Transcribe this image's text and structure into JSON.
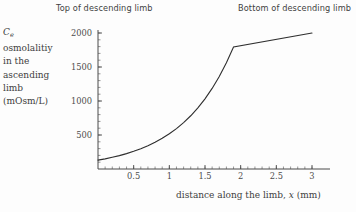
{
  "annotations": {
    "top_left": "Top of descending limb",
    "top_right": "Bottom of descending limb"
  },
  "ylabel": {
    "line1_symbol": "C",
    "line1_subscript": "e",
    "line2": "osmolalitiy",
    "line3": "in the",
    "line4": "ascending",
    "line5": "limb",
    "line6": "(mOsm/L)"
  },
  "xlabel": {
    "prefix": "distance along the limb, ",
    "symbol": "x",
    "suffix": " (mm)"
  },
  "axis": {
    "x_ticks": [
      "0.5",
      "1",
      "1.5",
      "2",
      "2.5",
      "3"
    ],
    "y_ticks": [
      "500",
      "1000",
      "1500",
      "2000"
    ]
  },
  "colors": {
    "background": "#fdfdfd",
    "curve": "#2e2e2e",
    "axis": "#4a4a4a",
    "text": "#3f3f3f"
  },
  "chart_data": {
    "type": "line",
    "title": "",
    "xlabel": "distance along the limb, x (mm)",
    "ylabel": "Ce osmolalitiy in the ascending limb (mOsm/L)",
    "xlim": [
      0,
      3.05
    ],
    "ylim": [
      0,
      2100
    ],
    "grid": false,
    "legend": "none",
    "x_tick_values": [
      0.5,
      1,
      1.5,
      2,
      2.5,
      3
    ],
    "y_tick_values": [
      500,
      1000,
      1500,
      2000
    ],
    "x_minor_tick_step": 0.1,
    "y_minor_tick_step": 100,
    "annotations": [
      {
        "text": "Top of descending limb",
        "at_x": 0,
        "position": "above-left"
      },
      {
        "text": "Bottom of descending limb",
        "at_x": 3,
        "position": "above-right"
      }
    ],
    "series": [
      {
        "name": "Ce(x)",
        "description": "exponential rise from ~130 mOsm/L at x=0 to ~2000 mOsm/L at x=3",
        "x": [
          0,
          0.1,
          0.2,
          0.3,
          0.4,
          0.5,
          0.6,
          0.7,
          0.8,
          0.9,
          1.0,
          1.1,
          1.2,
          1.3,
          1.4,
          1.5,
          1.6,
          1.7,
          1.8,
          1.9,
          2.0,
          2.1,
          2.2,
          2.3,
          2.4,
          2.5,
          2.6,
          2.7,
          2.8,
          2.9,
          3.0
        ],
        "y": [
          130,
          149,
          172,
          197,
          226,
          260,
          298,
          342,
          393,
          451,
          518,
          594,
          682,
          783,
          899,
          1032,
          1185,
          1360,
          1562,
          1793,
          2058,
          2362,
          2712,
          3113,
          3574,
          4103,
          4710,
          5408,
          6209,
          7128,
          8183
        ]
      }
    ],
    "note": "Curve drawn over visible range terminates at (3, 2000) at top of plot area"
  }
}
